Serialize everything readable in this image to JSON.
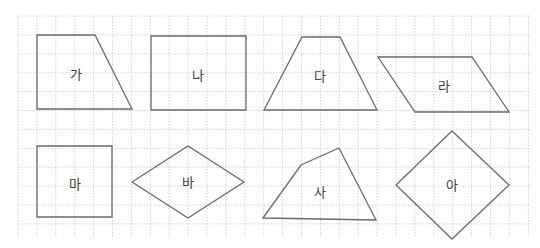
{
  "grid": {
    "left": 18,
    "top": 16,
    "right": 530,
    "bottom": 238,
    "spacing": 18.9,
    "color": "#c8c8c8"
  },
  "shape_color": "#6a6a6a",
  "label_color": "#3c3c3c",
  "shapes": [
    {
      "id": "ga",
      "label": "가",
      "kind": "trapezoid (right-angled)",
      "points": [
        [
          37,
          35
        ],
        [
          95,
          35
        ],
        [
          132,
          109
        ],
        [
          37,
          109
        ]
      ],
      "label_pos": [
        76,
        74
      ]
    },
    {
      "id": "na",
      "label": "나",
      "kind": "rectangle",
      "points": [
        [
          151,
          36
        ],
        [
          246,
          36
        ],
        [
          246,
          110
        ],
        [
          151,
          110
        ]
      ],
      "label_pos": [
        198,
        75
      ]
    },
    {
      "id": "da",
      "label": "다",
      "kind": "isosceles trapezoid",
      "points": [
        [
          302,
          37
        ],
        [
          340,
          37
        ],
        [
          377,
          110
        ],
        [
          264,
          110
        ]
      ],
      "label_pos": [
        320,
        76
      ]
    },
    {
      "id": "ra",
      "label": "라",
      "kind": "parallelogram",
      "points": [
        [
          378,
          57
        ],
        [
          472,
          57
        ],
        [
          509,
          112
        ],
        [
          415,
          112
        ]
      ],
      "label_pos": [
        444,
        86
      ]
    },
    {
      "id": "ma",
      "label": "마",
      "kind": "square",
      "points": [
        [
          37,
          146
        ],
        [
          112,
          146
        ],
        [
          112,
          217
        ],
        [
          37,
          217
        ]
      ],
      "label_pos": [
        75,
        184
      ]
    },
    {
      "id": "ba",
      "label": "바",
      "kind": "rhombus",
      "points": [
        [
          132,
          182
        ],
        [
          188,
          146
        ],
        [
          244,
          182
        ],
        [
          188,
          218
        ]
      ],
      "label_pos": [
        188,
        182
      ]
    },
    {
      "id": "sa",
      "label": "사",
      "kind": "quadrilateral",
      "points": [
        [
          263,
          218
        ],
        [
          301,
          165
        ],
        [
          339,
          148
        ],
        [
          376,
          220
        ]
      ],
      "label_pos": [
        320,
        192
      ]
    },
    {
      "id": "a",
      "label": "아",
      "kind": "square (rotated)",
      "points": [
        [
          452,
          131
        ],
        [
          509,
          185
        ],
        [
          452,
          239
        ],
        [
          396,
          185
        ]
      ],
      "label_pos": [
        452,
        185
      ]
    }
  ]
}
